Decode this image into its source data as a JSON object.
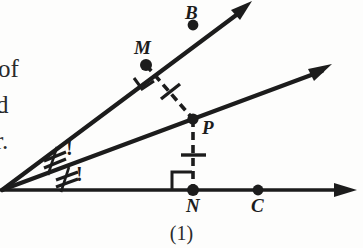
{
  "figure": {
    "caption": "(1)",
    "background_color": "#fdfdfc",
    "ink_color": "#1c1c1c",
    "width": 363,
    "height": 248
  },
  "margin_text": {
    "fragments": [
      "of",
      "d",
      "r."
    ]
  },
  "points": {
    "B": {
      "label": "B",
      "x": 193,
      "y": 25
    },
    "M": {
      "label": "M",
      "x": 146,
      "y": 65
    },
    "P": {
      "label": "P",
      "x": 193,
      "y": 119
    },
    "N": {
      "label": "N",
      "x": 193,
      "y": 190
    },
    "C": {
      "label": "C",
      "x": 258,
      "y": 190
    },
    "vertex": {
      "label": "",
      "x": 2,
      "y": 190
    }
  },
  "rays": [
    {
      "name": "upper-ray",
      "from": "vertex",
      "through": [
        "M",
        "B"
      ],
      "end_x": 250,
      "end_y": 2,
      "arrow": true
    },
    {
      "name": "middle-ray",
      "from": "vertex",
      "through": [
        "P"
      ],
      "end_x": 330,
      "end_y": 66,
      "arrow": true
    },
    {
      "name": "horizontal-ray",
      "from": "vertex",
      "through": [
        "N",
        "C"
      ],
      "end_x": 356,
      "end_y": 190,
      "arrow": true
    }
  ],
  "segments": [
    {
      "name": "segment-MP",
      "from": "M",
      "to": "P",
      "style": "dashed",
      "tick_count": 1
    },
    {
      "name": "segment-PN",
      "from": "P",
      "to": "N",
      "style": "dashed",
      "tick_count": 1
    }
  ],
  "right_angle_marks": [
    {
      "name": "right-angle-at-M",
      "at": "M"
    },
    {
      "name": "right-angle-at-N",
      "at": "N"
    }
  ],
  "angle_marks": [
    {
      "name": "angle-mark-upper",
      "ticks": 2,
      "annotation": "!"
    },
    {
      "name": "angle-mark-lower",
      "ticks": 2,
      "annotation": "!"
    }
  ]
}
